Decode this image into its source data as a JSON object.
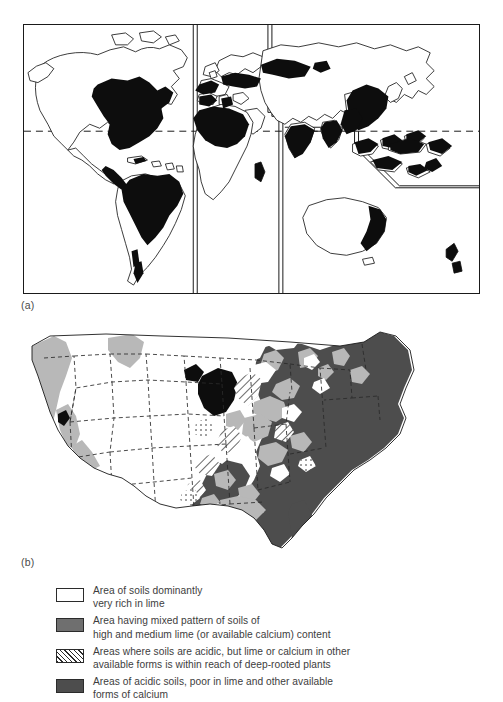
{
  "figure": {
    "panels": [
      {
        "label": "(a)",
        "name": "world-distribution-map"
      },
      {
        "label": "(b)",
        "name": "united-states-soil-lime-map"
      }
    ]
  },
  "legend": {
    "items": [
      {
        "swatch": "white-open-rectangle",
        "pattern": "solid-white",
        "color": "#ffffff",
        "text": "Area of soils dominantly\nvery rich in lime"
      },
      {
        "swatch": "medium-gray-rectangle",
        "pattern": "solid-medium-gray",
        "color": "#6f6f6f",
        "text": "Area having mixed pattern of soils of\nhigh and medium lime (or available calcium) content"
      },
      {
        "swatch": "diagonal-hatched-rectangle",
        "pattern": "diagonal-hatch",
        "color": "#2b2b2b",
        "text": "Areas where soils are acidic, but lime or calcium in other\navailable forms is within reach of deep-rooted plants"
      },
      {
        "swatch": "dark-gray-rectangle",
        "pattern": "solid-dark-gray",
        "color": "#4d4d4d",
        "text": "Areas of acidic soils, poor in lime and other available\nforms of calcium"
      }
    ]
  },
  "colors": {
    "ink": "#1a1a1a",
    "fill_black": "#0d0d0d",
    "fill_medium_gray": "#6f6f6f",
    "fill_dark_gray": "#4d4d4d",
    "fill_light_gray": "#b8b8b8",
    "fill_white": "#ffffff",
    "text": "#3d3d3d",
    "background": "#ffffff"
  },
  "world_map": {
    "equator_style": "dashed",
    "frame": "rectangular-border",
    "shaded_meaning": "black = areas of soils dominantly very rich in lime"
  },
  "us_map": {
    "state_boundaries": "dashed",
    "coastline": "solid-thin"
  }
}
